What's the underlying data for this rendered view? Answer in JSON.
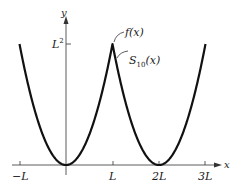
{
  "chart_data": {
    "type": "line",
    "title": "",
    "xlabel": "x",
    "ylabel": "y",
    "x_ticks": [
      "-L",
      "L",
      "2L",
      "3L"
    ],
    "x_tick_values": [
      -1,
      1,
      2,
      3
    ],
    "y_ticks": [
      "L²"
    ],
    "y_tick_values": [
      1
    ],
    "xlim": [
      -1.1,
      3.2
    ],
    "ylim": [
      0,
      1.3
    ],
    "grid": false,
    "legend": "annotations",
    "series": [
      {
        "name": "f(x)",
        "description": "periodic extension of x^2 on [-L, L], period 2L (units of L)",
        "x": [
          -1,
          -0.75,
          -0.5,
          -0.25,
          0,
          0.25,
          0.5,
          0.75,
          1,
          1.25,
          1.5,
          1.75,
          2,
          2.25,
          2.5,
          2.75,
          3
        ],
        "values": [
          1,
          0.5625,
          0.25,
          0.0625,
          0,
          0.0625,
          0.25,
          0.5625,
          1,
          0.5625,
          0.25,
          0.0625,
          0,
          0.0625,
          0.25,
          0.5625,
          1
        ]
      },
      {
        "name": "S10(x)",
        "description": "10th partial Fourier sum, nearly coincident with f(x)",
        "x": [
          -1,
          0,
          1,
          2,
          3
        ],
        "values": [
          0.99,
          0,
          0.99,
          0,
          0.99
        ]
      }
    ],
    "annotations": [
      {
        "text": "f(x)",
        "points_to": [
          1,
          1
        ]
      },
      {
        "text": "S10(x)",
        "points_to": [
          1.05,
          0.85
        ]
      }
    ]
  },
  "labels": {
    "y_axis": "y",
    "x_axis": "x",
    "y_tick": "L",
    "y_tick_sup": "2",
    "x_tick_neg_l": "−L",
    "x_tick_l": "L",
    "x_tick_2l": "2L",
    "x_tick_3l": "3L",
    "annot_f": "f(x)",
    "annot_s_main": "S",
    "annot_s_sub": "10",
    "annot_s_arg": "(x)"
  }
}
